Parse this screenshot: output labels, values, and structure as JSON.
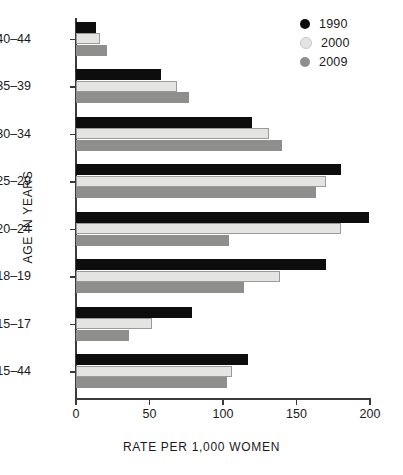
{
  "chart_data": {
    "type": "bar",
    "orientation": "horizontal",
    "title": "",
    "xlabel": "RATE PER 1,000 WOMEN",
    "ylabel": "AGE IN YEARS",
    "categories": [
      "40–44",
      "35–39",
      "30–34",
      "25–29",
      "20–24",
      "18–19",
      "15–17",
      "15–44"
    ],
    "series": [
      {
        "name": "1990",
        "color": "#0d0d0d",
        "values": [
          13.6,
          57.8,
          120,
          180,
          199,
          170,
          79,
          117
        ]
      },
      {
        "name": "2000",
        "color": "#e4e4e2",
        "values": [
          16.3,
          68.7,
          131,
          170,
          180,
          139,
          52,
          106
        ]
      },
      {
        "name": "2009",
        "color": "#8e8e8c",
        "values": [
          21,
          77,
          140,
          163,
          104,
          114,
          36,
          103
        ]
      }
    ],
    "xlim": [
      0,
      200
    ],
    "xticks": [
      0,
      50,
      100,
      150,
      200
    ],
    "xtick_labels": [
      "0",
      "50",
      "100",
      "150",
      "200"
    ],
    "grid": false,
    "legend_position": "top-right"
  },
  "legend": {
    "entries": [
      {
        "label": "1990",
        "color": "#0d0d0d"
      },
      {
        "label": "2000",
        "color": "#e4e4e2"
      },
      {
        "label": "2009",
        "color": "#8e8e8c"
      }
    ]
  }
}
